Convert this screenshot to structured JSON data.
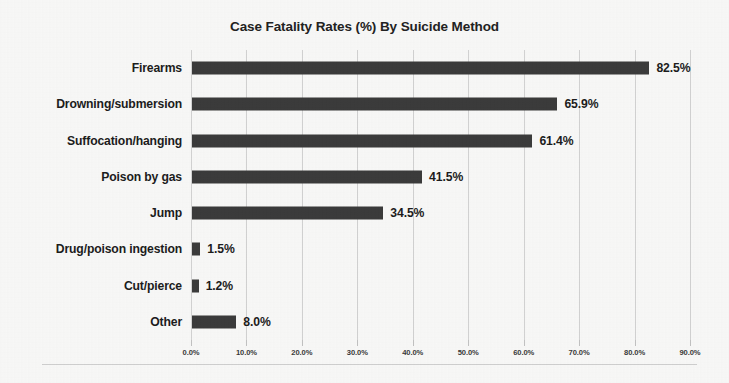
{
  "chart_data": {
    "type": "bar",
    "orientation": "horizontal",
    "title": "Case Fatality Rates (%) By Suicide Method",
    "xlabel": "",
    "ylabel": "",
    "categories": [
      "Firearms",
      "Drowning/submersion",
      "Suffocation/hanging",
      "Poison by gas",
      "Jump",
      "Drug/poison ingestion",
      "Cut/pierce",
      "Other"
    ],
    "values": [
      82.5,
      65.9,
      61.4,
      41.5,
      34.5,
      1.5,
      1.2,
      8.0
    ],
    "data_labels": [
      "82.5%",
      "65.9%",
      "61.4%",
      "41.5%",
      "34.5%",
      "1.5%",
      "1.2%",
      "8.0%"
    ],
    "xlim": [
      0,
      90
    ],
    "xtick_values": [
      0,
      10,
      20,
      30,
      40,
      50,
      60,
      70,
      80,
      90
    ],
    "xtick_labels": [
      "0.0%",
      "10.0%",
      "20.0%",
      "30.0%",
      "40.0%",
      "50.0%",
      "60.0%",
      "70.0%",
      "80.0%",
      "90.0%"
    ],
    "grid": "vertical",
    "legend": "none",
    "bar_color": "#3b3b3b",
    "gridline_color": "#d2d2d2",
    "background_color": "#f8f8f7",
    "text_color": "#1c1c1c"
  }
}
